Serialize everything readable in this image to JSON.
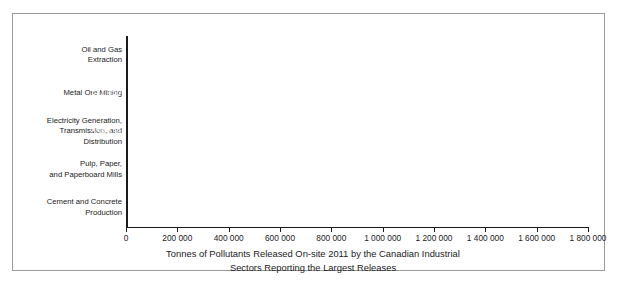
{
  "chart_data": {
    "type": "bar",
    "orientation": "horizontal",
    "title": "",
    "xlabel_line1": "Tonnes of Pollutants Released On-site 2011 by the Canadian Industrial",
    "xlabel_line2": "Sectors Reporting the Largest Releases",
    "ylabel": "",
    "xlim": [
      0,
      1800000
    ],
    "grid": false,
    "legend": false,
    "bar_color": "#414141",
    "axis_color": "#1a1a1a",
    "frame_color": "#9b9b9b",
    "value_label_color": "#ffffff",
    "xticks": [
      0,
      200000,
      400000,
      600000,
      800000,
      1000000,
      1200000,
      1400000,
      1600000,
      1800000
    ],
    "xtick_labels": [
      "0",
      "200 000",
      "400 000",
      "600 000",
      "800 000",
      "1 000 000",
      "1 200 000",
      "1 400 000",
      "1 600 000",
      "1 800 000"
    ],
    "categories": [
      "Oil and Gas\nExtraction",
      "Metal Ore Mining",
      "Electricity Generation,\nTransmission, and\nDistribution",
      "Pulp, Paper,\nand Paperboard Mills",
      "Cement and Concrete\nProduction"
    ],
    "values": [
      1631170,
      577450,
      558039,
      195258,
      128993
    ],
    "value_labels": [
      "1 631 170",
      "577 450",
      "558 039",
      "195 258",
      "128 993"
    ]
  }
}
